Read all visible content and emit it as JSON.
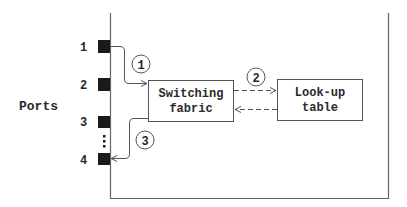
{
  "diagram": {
    "ports_label": "Ports",
    "ports": [
      {
        "label": "1"
      },
      {
        "label": "2"
      },
      {
        "label": "3"
      },
      {
        "label": "4"
      }
    ],
    "boxes": {
      "switching_fabric": {
        "line1": "Switching",
        "line2": "fabric"
      },
      "lookup_table": {
        "line1": "Look-up",
        "line2": "table"
      }
    },
    "steps": [
      {
        "label": "1"
      },
      {
        "label": "2"
      },
      {
        "label": "3"
      }
    ],
    "colors": {
      "stroke": "#555555",
      "port_fill": "#1a1a1a",
      "text": "#2a2a2a"
    }
  }
}
